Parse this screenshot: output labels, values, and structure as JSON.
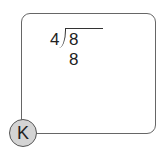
{
  "problem": {
    "divisor": "4",
    "dividend": "8 8"
  },
  "badge": {
    "label": "K"
  }
}
